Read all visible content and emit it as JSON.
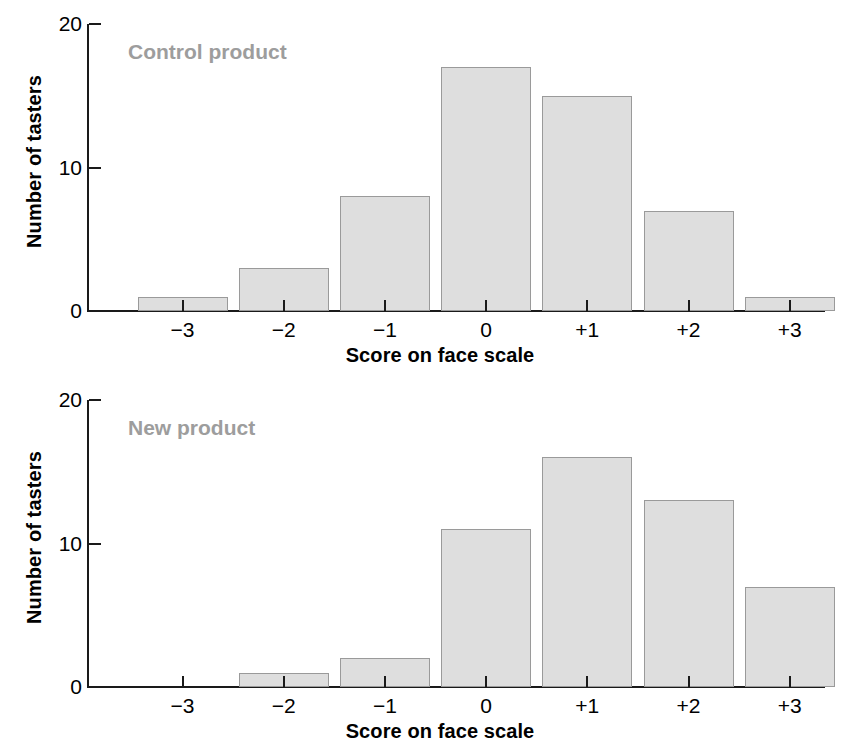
{
  "figure": {
    "background": "#ffffff",
    "bar_fill": "#dedede",
    "bar_stroke": "#9a9a9a",
    "axis_color": "#1a1a1a",
    "title_color": "#9d9d9d"
  },
  "chart_data": [
    {
      "type": "bar",
      "title": "Control product",
      "categories": [
        "−3",
        "−2",
        "−1",
        "0",
        "+1",
        "+2",
        "+3"
      ],
      "values": [
        1,
        3,
        8,
        17,
        15,
        7,
        1
      ],
      "xlabel": "Score on face scale",
      "ylabel": "Number of tasters",
      "ylim": [
        0,
        20
      ],
      "yticks": [
        0,
        10,
        20
      ],
      "ytick_labels": [
        "0",
        "10",
        "20"
      ],
      "grid": false,
      "legend": "none"
    },
    {
      "type": "bar",
      "title": "New product",
      "categories": [
        "−3",
        "−2",
        "−1",
        "0",
        "+1",
        "+2",
        "+3"
      ],
      "values": [
        0,
        1,
        2,
        11,
        16,
        13,
        7
      ],
      "xlabel": "Score on face scale",
      "ylabel": "Number of tasters",
      "ylim": [
        0,
        20
      ],
      "yticks": [
        0,
        10,
        20
      ],
      "ytick_labels": [
        "0",
        "10",
        "20"
      ],
      "grid": false,
      "legend": "none"
    }
  ]
}
